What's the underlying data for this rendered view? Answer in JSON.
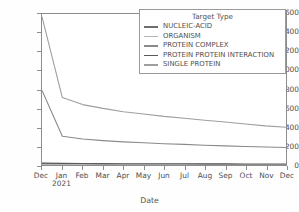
{
  "chart_data": {
    "type": "line",
    "title": "",
    "xlabel": "Date",
    "ylabel": "",
    "ylim": [
      0,
      1600
    ],
    "yticks": [
      0,
      200,
      400,
      600,
      800,
      1000,
      1200,
      1400,
      1600
    ],
    "grid": false,
    "legend_position": "upper right",
    "legend_title": "Target Type",
    "categories": [
      "Dec",
      "Jan 2021",
      "Feb",
      "Mar",
      "Apr",
      "May",
      "Jun",
      "Jul",
      "Aug",
      "Sep",
      "Oct",
      "Nov",
      "Dec"
    ],
    "xtick_labels": [
      {
        "month": "Dec",
        "year": ""
      },
      {
        "month": "Jan",
        "year": "2021"
      },
      {
        "month": "Feb",
        "year": ""
      },
      {
        "month": "Mar",
        "year": ""
      },
      {
        "month": "Apr",
        "year": ""
      },
      {
        "month": "May",
        "year": ""
      },
      {
        "month": "Jun",
        "year": ""
      },
      {
        "month": "Jul",
        "year": ""
      },
      {
        "month": "Aug",
        "year": ""
      },
      {
        "month": "Sep",
        "year": ""
      },
      {
        "month": "Oct",
        "year": ""
      },
      {
        "month": "Nov",
        "year": ""
      },
      {
        "month": "Dec",
        "year": ""
      }
    ],
    "series": [
      {
        "name": "NUCLEIC-ACID",
        "color": "#6e6e6e",
        "values": [
          12,
          10,
          9,
          9,
          8,
          8,
          8,
          7,
          7,
          7,
          6,
          6,
          6
        ]
      },
      {
        "name": "ORGANISM",
        "color": "#b4b4b4",
        "values": [
          8,
          7,
          6,
          6,
          6,
          5,
          5,
          5,
          5,
          4,
          4,
          4,
          4
        ]
      },
      {
        "name": "PROTEIN COMPLEX",
        "color": "#8a8a8a",
        "values": [
          790,
          305,
          275,
          258,
          245,
          235,
          225,
          218,
          210,
          203,
          196,
          190,
          185
        ]
      },
      {
        "name": "PROTEIN PROTEIN INTERACTION",
        "color": "#5a5a5a",
        "values": [
          20,
          17,
          16,
          15,
          14,
          14,
          13,
          13,
          12,
          12,
          11,
          11,
          10
        ]
      },
      {
        "name": "SINGLE PROTEIN",
        "color": "#9e9e9e",
        "values": [
          1570,
          715,
          640,
          600,
          565,
          540,
          515,
          495,
          475,
          455,
          435,
          415,
          400
        ]
      }
    ]
  }
}
